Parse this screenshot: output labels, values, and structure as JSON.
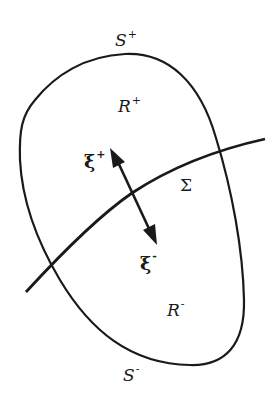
{
  "diagram": {
    "stroke_color": "#1a1a1a",
    "background": "#ffffff",
    "labels": {
      "s_plus": {
        "base": "S",
        "sup": "+"
      },
      "r_plus": {
        "base": "R",
        "sup": "+"
      },
      "xi_plus": {
        "base": "ξ",
        "sup": "+"
      },
      "sigma": {
        "base": "Σ"
      },
      "xi_minus": {
        "base": "ξ",
        "sup": "-"
      },
      "r_minus": {
        "base": "R",
        "sup": "-"
      },
      "s_minus": {
        "base": "S",
        "sup": "-"
      }
    },
    "elements": {
      "closed_region": "closed boundary curve S = S+ ∪ S-",
      "interface": "surface Σ dividing R+ and R-",
      "normal_arrow": "double-headed arrow ξ+ / ξ- across Σ"
    }
  }
}
